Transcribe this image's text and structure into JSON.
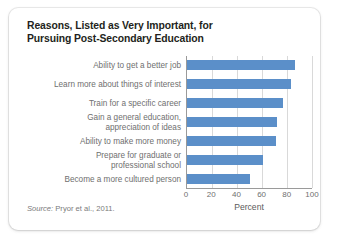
{
  "figure": {
    "title_lines": [
      "Reasons, Listed as Very Important, for",
      "Pursuing Post-Secondary Education"
    ],
    "source_label": "Source:",
    "source_text": " Pryor et al., 2011.",
    "bar_color": "#5b8fc9",
    "label_color": "#6f6f6f",
    "title_color": "#231f20",
    "axis_color": "#9a9a9a",
    "gridline_color": "#d9d9d9",
    "card_background": "#ffffff"
  },
  "chart_data": {
    "type": "bar",
    "orientation": "horizontal",
    "title": "Reasons, Listed as Very Important, for Pursuing Post-Secondary Education",
    "categories": [
      "Ability to get a better job",
      "Learn more about things of interest",
      "Train for a specific career",
      "Gain a general education,\nappreciation of ideas",
      "Ability to make more money",
      "Prepare for graduate or\nprofessional school",
      "Become a more cultured person"
    ],
    "values": [
      86,
      83,
      77,
      72,
      71,
      61,
      50
    ],
    "xlabel": "Percent",
    "ylabel": "",
    "xlim": [
      0,
      100
    ],
    "xticks": [
      0,
      20,
      40,
      60,
      80,
      100
    ],
    "grid": "vertical",
    "legend": "none"
  }
}
